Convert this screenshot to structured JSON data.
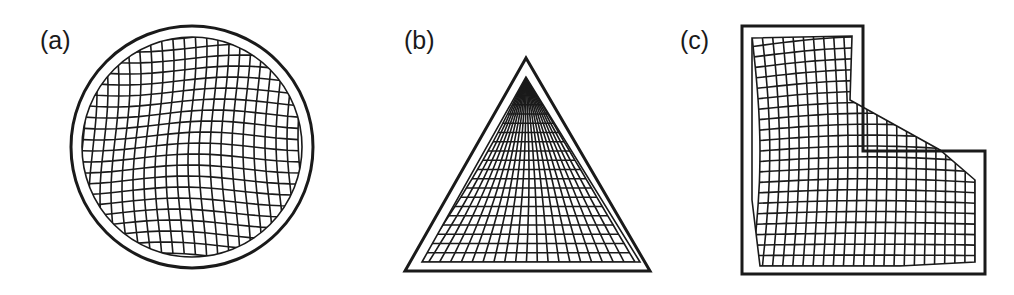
{
  "panels": [
    {
      "id": "a",
      "label": "(a)",
      "shape": "circle"
    },
    {
      "id": "b",
      "label": "(b)",
      "shape": "triangle"
    },
    {
      "id": "c",
      "label": "(c)",
      "shape": "L-shape"
    }
  ],
  "colors": {
    "stroke": "#1a1a1a",
    "background": "#ffffff"
  }
}
